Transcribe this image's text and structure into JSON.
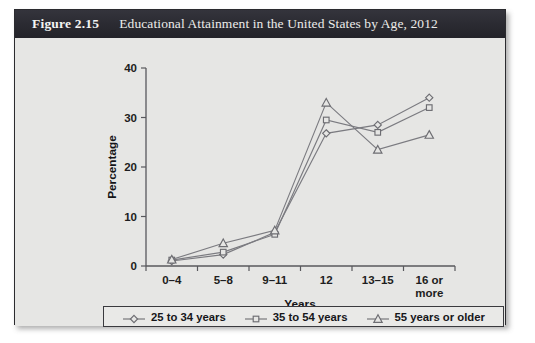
{
  "figure": {
    "number_label": "Figure 2.15",
    "caption": "Educational Attainment in the United States by Age, 2012",
    "frame_border_color": "#2b2b2f",
    "titlebar_color": "#2a2a31",
    "plot_background_color": "#e6e6e4",
    "line_color": "#7b7b80"
  },
  "chart_data": {
    "type": "line",
    "title": "Educational Attainment in the United States by Age, 2012",
    "xlabel": "Years",
    "ylabel": "Percentage",
    "categories": [
      "0–4",
      "5–8",
      "9–11",
      "12",
      "13–15",
      "16 or more"
    ],
    "category_lines": [
      [
        "0–4"
      ],
      [
        "5–8"
      ],
      [
        "9–11"
      ],
      [
        "12"
      ],
      [
        "13–15"
      ],
      [
        "16 or",
        "more"
      ]
    ],
    "ylim": [
      0,
      40
    ],
    "yticks": [
      0,
      10,
      20,
      30,
      40
    ],
    "ytick_labels": [
      "0",
      "10",
      "20",
      "30",
      "40"
    ],
    "grid": false,
    "legend_position": "bottom",
    "series": [
      {
        "name": "25 to 34 years",
        "marker": "diamond",
        "values": [
          1.0,
          2.3,
          6.8,
          26.8,
          28.5,
          34.0
        ]
      },
      {
        "name": "35 to 54 years",
        "marker": "square",
        "values": [
          1.2,
          2.8,
          6.4,
          29.5,
          27.0,
          32.0
        ]
      },
      {
        "name": "55 years or older",
        "marker": "triangle",
        "values": [
          1.3,
          4.6,
          7.2,
          33.0,
          23.5,
          26.5
        ]
      }
    ]
  },
  "legend": {
    "entries": [
      {
        "label": "25 to 34 years",
        "marker": "diamond"
      },
      {
        "label": "35 to 54 years",
        "marker": "square"
      },
      {
        "label": "55 years or older",
        "marker": "triangle"
      }
    ]
  }
}
